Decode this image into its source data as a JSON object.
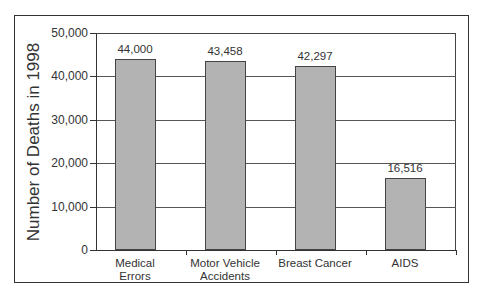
{
  "chart_data": {
    "type": "bar",
    "title": "",
    "xlabel": "",
    "ylabel": "Number of Deaths in 1998",
    "ylim": [
      0,
      50000
    ],
    "yticks": [
      "0",
      "10,000",
      "20,000",
      "30,000",
      "40,000",
      "50,000"
    ],
    "categories": [
      "Medical Errors",
      "Motor Vehicle Accidents",
      "Breast Cancer",
      "AIDS"
    ],
    "category_lines": [
      [
        "Medical",
        "Errors"
      ],
      [
        "Motor Vehicle",
        "Accidents"
      ],
      [
        "Breast Cancer"
      ],
      [
        "AIDS"
      ]
    ],
    "values": [
      44000,
      43458,
      42297,
      16516
    ],
    "data_labels": [
      "44,000",
      "43,458",
      "42,297",
      "16,516"
    ],
    "grid": true,
    "legend": null
  },
  "colors": {
    "bar_fill": "#b3b3b3",
    "bar_edge": "#444444",
    "grid": "#555555",
    "text": "#333333"
  }
}
